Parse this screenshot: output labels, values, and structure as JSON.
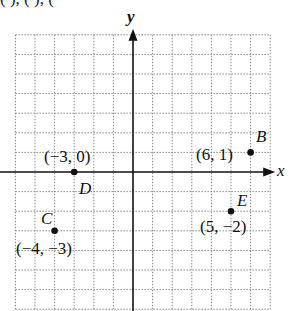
{
  "header_fragment": "(   ),        (          ),        (",
  "axes": {
    "x_label": "x",
    "y_label": "y",
    "origin_px": [
      133,
      172
    ],
    "unit_px": 19.6,
    "x_range": [
      -6,
      7
    ],
    "y_range": [
      -7,
      7
    ]
  },
  "points": [
    {
      "name": "B",
      "coords": "(6, 1)",
      "x": 6,
      "y": 1
    },
    {
      "name": "D",
      "coords": "(−3, 0)",
      "x": -3,
      "y": 0
    },
    {
      "name": "C",
      "coords": "(−4, −3)",
      "x": -4,
      "y": -3
    },
    {
      "name": "E",
      "coords": "(5, −2)",
      "x": 5,
      "y": -2
    }
  ],
  "colors": {
    "grid": "#8a8a8a",
    "axis": "#111111",
    "point": "#111111",
    "background": "#ffffff"
  }
}
